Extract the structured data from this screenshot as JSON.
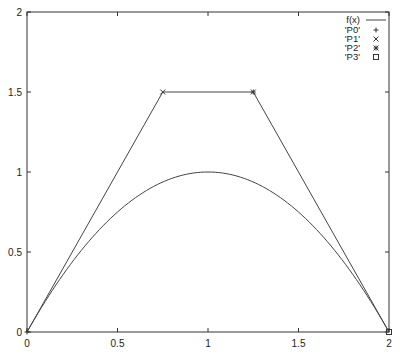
{
  "chart_data": {
    "type": "line",
    "title": "",
    "xlabel": "",
    "ylabel": "",
    "xlim": [
      0,
      2
    ],
    "ylim": [
      0,
      2
    ],
    "grid": false,
    "legend_position": "top-right (inside)",
    "x_ticks": [
      "0",
      "0.5",
      "1",
      "1.5",
      "2"
    ],
    "y_ticks": [
      "0",
      "0.5",
      "1",
      "1.5",
      "2"
    ],
    "series": [
      {
        "name": "f(x)",
        "style": "line",
        "function": "x*(2-x)",
        "x": [
          0,
          0.25,
          0.5,
          0.75,
          1,
          1.25,
          1.5,
          1.75,
          2
        ],
        "y": [
          0,
          0.4375,
          0.75,
          0.9375,
          1,
          0.9375,
          0.75,
          0.4375,
          0
        ]
      },
      {
        "name": "'P0'",
        "style": "points",
        "marker": "+",
        "x": [
          0
        ],
        "y": [
          0
        ]
      },
      {
        "name": "'P1'",
        "style": "points",
        "marker": "x",
        "x": [
          0.75
        ],
        "y": [
          1.5
        ]
      },
      {
        "name": "'P2'",
        "style": "points",
        "marker": "*",
        "x": [
          1.25
        ],
        "y": [
          1.5
        ]
      },
      {
        "name": "'P3'",
        "style": "points",
        "marker": "square",
        "x": [
          2
        ],
        "y": [
          0
        ]
      }
    ],
    "control_polygon": {
      "x": [
        0,
        0.75,
        1.25,
        2
      ],
      "y": [
        0,
        1.5,
        1.5,
        0
      ]
    }
  },
  "legend": {
    "items": [
      "f(x)",
      "'P0'",
      "'P1'",
      "'P2'",
      "'P3'"
    ]
  },
  "colors": {
    "line": "#333333",
    "axis": "#333333",
    "background": "#ffffff"
  }
}
